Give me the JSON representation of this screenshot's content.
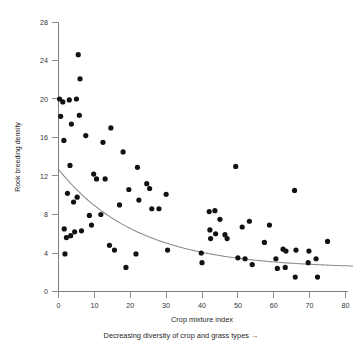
{
  "chart_data": {
    "type": "scatter",
    "title": "",
    "xlabel": "Crop mixture index",
    "ylabel": "Rook breeding density",
    "sub_caption": "Decreasing diversity of crop and grass types →",
    "xlim": [
      0,
      80
    ],
    "ylim": [
      0,
      28
    ],
    "xticks": [
      0,
      10,
      20,
      30,
      40,
      50,
      60,
      70,
      80
    ],
    "yticks": [
      0,
      4,
      8,
      12,
      16,
      20,
      24,
      28
    ],
    "xtick_labels": [
      "0",
      "10",
      "20",
      "30",
      "40",
      "50",
      "60",
      "70",
      "80"
    ],
    "ytick_labels": [
      "0",
      "4",
      "8",
      "12",
      "16",
      "20",
      "24",
      "28"
    ],
    "grid": false,
    "legend": "none",
    "marker": {
      "shape": "circle",
      "color": "#121214",
      "size": 2.6
    },
    "points": [
      [
        0.3,
        20.0
      ],
      [
        0.6,
        18.2
      ],
      [
        1.2,
        19.7
      ],
      [
        1.5,
        15.7
      ],
      [
        1.6,
        6.5
      ],
      [
        1.8,
        3.9
      ],
      [
        2.2,
        5.6
      ],
      [
        2.5,
        10.2
      ],
      [
        3.0,
        19.9
      ],
      [
        3.2,
        13.1
      ],
      [
        3.4,
        5.8
      ],
      [
        3.6,
        17.4
      ],
      [
        4.2,
        9.3
      ],
      [
        4.5,
        6.2
      ],
      [
        5.0,
        20.0
      ],
      [
        5.2,
        9.8
      ],
      [
        5.5,
        24.6
      ],
      [
        5.8,
        18.3
      ],
      [
        6.0,
        22.1
      ],
      [
        6.4,
        6.3
      ],
      [
        7.6,
        16.2
      ],
      [
        8.6,
        7.9
      ],
      [
        9.2,
        6.9
      ],
      [
        9.8,
        12.2
      ],
      [
        10.6,
        11.7
      ],
      [
        11.8,
        8.0
      ],
      [
        12.4,
        15.5
      ],
      [
        13.0,
        11.7
      ],
      [
        14.2,
        4.8
      ],
      [
        14.6,
        17.0
      ],
      [
        15.6,
        4.3
      ],
      [
        17.0,
        9.0
      ],
      [
        18.0,
        14.5
      ],
      [
        18.8,
        2.5
      ],
      [
        19.6,
        10.6
      ],
      [
        21.6,
        3.9
      ],
      [
        22.0,
        12.9
      ],
      [
        22.4,
        9.5
      ],
      [
        24.6,
        11.2
      ],
      [
        25.4,
        10.7
      ],
      [
        26.0,
        8.6
      ],
      [
        28.0,
        8.6
      ],
      [
        30.0,
        10.1
      ],
      [
        30.4,
        4.3
      ],
      [
        39.8,
        4.0
      ],
      [
        40.0,
        3.0
      ],
      [
        42.0,
        8.3
      ],
      [
        42.2,
        6.4
      ],
      [
        42.4,
        5.5
      ],
      [
        43.6,
        8.4
      ],
      [
        43.8,
        6.0
      ],
      [
        45.0,
        7.5
      ],
      [
        46.4,
        5.9
      ],
      [
        47.0,
        5.5
      ],
      [
        49.4,
        13.0
      ],
      [
        50.0,
        3.5
      ],
      [
        51.2,
        6.7
      ],
      [
        52.0,
        3.4
      ],
      [
        53.2,
        7.3
      ],
      [
        54.0,
        2.8
      ],
      [
        57.4,
        5.1
      ],
      [
        58.8,
        6.9
      ],
      [
        60.6,
        3.4
      ],
      [
        61.0,
        2.4
      ],
      [
        62.6,
        4.4
      ],
      [
        63.2,
        2.5
      ],
      [
        63.4,
        4.2
      ],
      [
        65.8,
        10.5
      ],
      [
        66.0,
        1.5
      ],
      [
        66.2,
        4.3
      ],
      [
        69.6,
        3.0
      ],
      [
        69.8,
        4.2
      ],
      [
        71.8,
        3.4
      ],
      [
        72.2,
        1.5
      ],
      [
        75.0,
        5.2
      ]
    ],
    "fit_curve": {
      "label": "",
      "description": "smooth decreasing exponential-like trend line",
      "x_start": 0,
      "x_end": 82,
      "y_start": 12.7,
      "y_end": 2.8,
      "model": "y = 2.4 + 10.3 * exp(-x / 22)"
    }
  }
}
